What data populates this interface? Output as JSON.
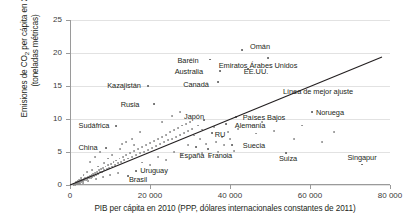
{
  "chart_data": {
    "type": "scatter",
    "title": "",
    "xlabel": "PIB per cápita en 2010 (PPP, dólares internacionales constantes de 2011)",
    "ylabel": "Emisiones de CO2 per cápita en 2010 (toneladas métricas)",
    "ylabel_line1": "Emisiones de CO",
    "ylabel_sub": "2",
    "ylabel_line1b": " per cápita en 2010",
    "ylabel_line2": "(toneladas métricas)",
    "xlim": [
      0,
      80000
    ],
    "ylim": [
      0,
      25
    ],
    "xticks": [
      0,
      20000,
      40000,
      60000,
      80000
    ],
    "xticklabels": [
      "0",
      "20 000",
      "40 000",
      "60 000",
      "80 000"
    ],
    "yticks": [
      0,
      5,
      10,
      15,
      20,
      25
    ],
    "yticklabels": [
      "0",
      "5",
      "10",
      "15",
      "20",
      "25"
    ],
    "grid": "horizontal",
    "legend": "none",
    "point_color": "#8c8c8c",
    "fit_line_color": "#231f20",
    "grid_color": "#e2e2e2",
    "axis_color": "#9a9a9a",
    "annotations": [
      {
        "label": "Omán",
        "x": 43000,
        "y": 20.4,
        "lx": 47500,
        "ly": 21.0
      },
      {
        "label": "Baréin",
        "x": 35000,
        "y": 19.0,
        "lx": 29500,
        "ly": 19.0
      },
      {
        "label": "Emiratos Árabes Unidos",
        "x": 49500,
        "y": 19.3,
        "lx": 47000,
        "ly": 18.2
      },
      {
        "label": "Australia",
        "x": 37500,
        "y": 17.3,
        "lx": 29700,
        "ly": 17.3
      },
      {
        "label": "EE.UU.",
        "x": 44500,
        "y": 17.6,
        "lx": 46500,
        "ly": 17.2
      },
      {
        "label": "Canadá",
        "x": 37000,
        "y": 15.6,
        "lx": 31500,
        "ly": 15.3
      },
      {
        "label": "Kazajistán",
        "x": 19500,
        "y": 15.0,
        "lx": 13500,
        "ly": 15.1
      },
      {
        "label": "Rusia",
        "x": 21000,
        "y": 12.3,
        "lx": 15000,
        "ly": 12.3
      },
      {
        "label": "Sudáfrica",
        "x": 11500,
        "y": 8.9,
        "lx": 6000,
        "ly": 9.1
      },
      {
        "label": "China",
        "x": 9000,
        "y": 5.6,
        "lx": 4500,
        "ly": 5.7
      },
      {
        "label": "Japón",
        "x": 33500,
        "y": 9.9,
        "lx": 31000,
        "ly": 10.5
      },
      {
        "label": "Países Bajos",
        "x": 41500,
        "y": 10.3,
        "lx": 48500,
        "ly": 10.3
      },
      {
        "label": "Alemania",
        "x": 39000,
        "y": 9.2,
        "lx": 45000,
        "ly": 9.1
      },
      {
        "label": "RU",
        "x": 35500,
        "y": 7.9,
        "lx": 37500,
        "ly": 7.8
      },
      {
        "label": "Suecia",
        "x": 40500,
        "y": 6.0,
        "lx": 46000,
        "ly": 6.0
      },
      {
        "label": "España",
        "x": 31500,
        "y": 5.7,
        "lx": 30500,
        "ly": 4.5
      },
      {
        "label": "Francia",
        "x": 34500,
        "y": 5.5,
        "lx": 37500,
        "ly": 4.5
      },
      {
        "label": "Suiza",
        "x": 54000,
        "y": 4.9,
        "lx": 54500,
        "ly": 4.1
      },
      {
        "label": "Noruega",
        "x": 60500,
        "y": 11.1,
        "lx": 65000,
        "ly": 11.1
      },
      {
        "label": "Singapur",
        "x": 73000,
        "y": 3.1,
        "lx": 73000,
        "ly": 4.2
      },
      {
        "label": "Uruguay",
        "x": 16500,
        "y": 2.1,
        "lx": 21000,
        "ly": 2.2
      },
      {
        "label": "Brasil",
        "x": 14500,
        "y": 1.3,
        "lx": 17000,
        "ly": 0.9
      },
      {
        "label": "Línea de mejor ajuste",
        "x": null,
        "y": null,
        "lx": 62000,
        "ly": 14.2
      }
    ],
    "fit_line": {
      "x0": 0,
      "y0": 0.0,
      "x1": 78000,
      "y1": 19.4
    },
    "points": [
      [
        900,
        0.05
      ],
      [
        1100,
        0.1
      ],
      [
        1200,
        0.15
      ],
      [
        1400,
        0.2
      ],
      [
        1500,
        0.1
      ],
      [
        1600,
        0.3
      ],
      [
        1800,
        0.25
      ],
      [
        2000,
        0.4
      ],
      [
        2100,
        0.3
      ],
      [
        2200,
        0.5
      ],
      [
        2400,
        0.35
      ],
      [
        2500,
        0.6
      ],
      [
        2700,
        0.45
      ],
      [
        2800,
        0.7
      ],
      [
        3000,
        0.55
      ],
      [
        3100,
        0.8
      ],
      [
        3300,
        0.6
      ],
      [
        3500,
        0.9
      ],
      [
        3600,
        0.7
      ],
      [
        3800,
        1.0
      ],
      [
        4000,
        0.8
      ],
      [
        4200,
        1.1
      ],
      [
        4400,
        0.95
      ],
      [
        4600,
        1.2
      ],
      [
        4800,
        1.0
      ],
      [
        5000,
        1.3
      ],
      [
        5200,
        1.1
      ],
      [
        5400,
        1.5
      ],
      [
        5600,
        1.2
      ],
      [
        5800,
        1.6
      ],
      [
        6000,
        1.4
      ],
      [
        6300,
        1.8
      ],
      [
        6500,
        1.5
      ],
      [
        6800,
        2.0
      ],
      [
        7000,
        1.7
      ],
      [
        7300,
        2.2
      ],
      [
        7500,
        1.9
      ],
      [
        7800,
        2.4
      ],
      [
        8000,
        2.0
      ],
      [
        8300,
        2.6
      ],
      [
        8600,
        2.2
      ],
      [
        8900,
        2.8
      ],
      [
        9200,
        2.4
      ],
      [
        9500,
        3.0
      ],
      [
        9800,
        2.6
      ],
      [
        10200,
        3.2
      ],
      [
        10500,
        2.8
      ],
      [
        10900,
        3.5
      ],
      [
        11200,
        3.0
      ],
      [
        11600,
        3.7
      ],
      [
        12000,
        3.3
      ],
      [
        12400,
        4.0
      ],
      [
        12800,
        3.5
      ],
      [
        13200,
        4.3
      ],
      [
        13600,
        3.8
      ],
      [
        14000,
        4.5
      ],
      [
        14500,
        4.0
      ],
      [
        15000,
        4.8
      ],
      [
        15500,
        4.3
      ],
      [
        16000,
        5.1
      ],
      [
        16500,
        4.5
      ],
      [
        17000,
        5.4
      ],
      [
        17500,
        4.8
      ],
      [
        18000,
        5.7
      ],
      [
        18500,
        5.0
      ],
      [
        19000,
        6.0
      ],
      [
        19500,
        5.3
      ],
      [
        20000,
        6.3
      ],
      [
        20500,
        5.6
      ],
      [
        21000,
        6.6
      ],
      [
        21500,
        5.9
      ],
      [
        22000,
        7.0
      ],
      [
        22500,
        6.2
      ],
      [
        23000,
        7.3
      ],
      [
        23500,
        6.5
      ],
      [
        24000,
        7.6
      ],
      [
        24500,
        6.8
      ],
      [
        25000,
        8.0
      ],
      [
        25500,
        7.0
      ],
      [
        26000,
        8.3
      ],
      [
        26500,
        7.3
      ],
      [
        27000,
        8.6
      ],
      [
        27500,
        7.6
      ],
      [
        28000,
        9.0
      ],
      [
        28500,
        7.9
      ],
      [
        29000,
        9.3
      ],
      [
        29500,
        8.2
      ],
      [
        30000,
        9.6
      ],
      [
        30500,
        8.5
      ],
      [
        31000,
        7.5
      ],
      [
        31500,
        5.7
      ],
      [
        32000,
        9.0
      ],
      [
        32500,
        7.0
      ],
      [
        33000,
        8.4
      ],
      [
        33500,
        9.9
      ],
      [
        34000,
        6.2
      ],
      [
        34500,
        5.5
      ],
      [
        35000,
        19.0
      ],
      [
        35500,
        7.9
      ],
      [
        36000,
        8.8
      ],
      [
        36500,
        6.5
      ],
      [
        37000,
        15.6
      ],
      [
        37500,
        17.3
      ],
      [
        38000,
        7.2
      ],
      [
        38500,
        6.0
      ],
      [
        39000,
        9.2
      ],
      [
        39500,
        8.0
      ],
      [
        40000,
        7.0
      ],
      [
        40500,
        6.0
      ],
      [
        41500,
        10.3
      ],
      [
        42000,
        8.5
      ],
      [
        43000,
        20.4
      ],
      [
        44500,
        17.6
      ],
      [
        45500,
        9.0
      ],
      [
        46500,
        7.8
      ],
      [
        48000,
        9.5
      ],
      [
        49500,
        19.3
      ],
      [
        51000,
        8.2
      ],
      [
        54000,
        4.9
      ],
      [
        56000,
        7.0
      ],
      [
        58000,
        9.0
      ],
      [
        60500,
        11.1
      ],
      [
        63000,
        6.5
      ],
      [
        66000,
        8.0
      ],
      [
        73000,
        3.1
      ],
      [
        5000,
        3.5
      ],
      [
        6200,
        4.3
      ],
      [
        7600,
        5.0
      ],
      [
        9000,
        5.6
      ],
      [
        11500,
        8.9
      ],
      [
        13000,
        6.2
      ],
      [
        15500,
        7.0
      ],
      [
        17500,
        8.0
      ],
      [
        19500,
        15.0
      ],
      [
        21000,
        12.3
      ],
      [
        23000,
        9.5
      ],
      [
        25500,
        10.5
      ],
      [
        27500,
        11.0
      ],
      [
        29500,
        6.0
      ],
      [
        16500,
        2.1
      ],
      [
        14500,
        1.3
      ],
      [
        12000,
        1.8
      ],
      [
        10000,
        1.5
      ],
      [
        8200,
        1.2
      ],
      [
        6500,
        0.9
      ],
      [
        4500,
        0.6
      ],
      [
        3200,
        0.35
      ],
      [
        2600,
        0.2
      ],
      [
        2000,
        0.12
      ],
      [
        1700,
        0.08
      ],
      [
        1300,
        0.05
      ],
      [
        26000,
        5.0
      ],
      [
        28000,
        4.5
      ],
      [
        30000,
        4.0
      ],
      [
        22000,
        4.2
      ],
      [
        24000,
        3.8
      ],
      [
        18000,
        3.4
      ],
      [
        20000,
        3.0
      ],
      [
        33000,
        4.8
      ],
      [
        35000,
        4.2
      ],
      [
        37000,
        5.0
      ],
      [
        39000,
        4.4
      ],
      [
        41000,
        5.2
      ],
      [
        12500,
        5.5
      ],
      [
        14000,
        6.5
      ],
      [
        16000,
        6.0
      ],
      [
        10500,
        4.5
      ],
      [
        9500,
        4.0
      ],
      [
        8500,
        3.3
      ],
      [
        7000,
        2.8
      ],
      [
        5500,
        2.3
      ],
      [
        4200,
        1.9
      ],
      [
        3400,
        1.5
      ],
      [
        2800,
        1.0
      ],
      [
        2200,
        0.8
      ],
      [
        1900,
        0.6
      ],
      [
        1500,
        0.4
      ]
    ]
  }
}
